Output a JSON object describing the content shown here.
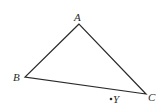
{
  "diagram": {
    "type": "triangle",
    "stroke_color": "#2a2a2a",
    "background": "#ffffff",
    "vertices": {
      "A": {
        "label": "A",
        "x": 79,
        "y": 24
      },
      "B": {
        "label": "B",
        "x": 25,
        "y": 77
      },
      "C": {
        "label": "C",
        "x": 146,
        "y": 94
      }
    },
    "point": {
      "label": "Y",
      "x": 111,
      "y": 99
    }
  }
}
